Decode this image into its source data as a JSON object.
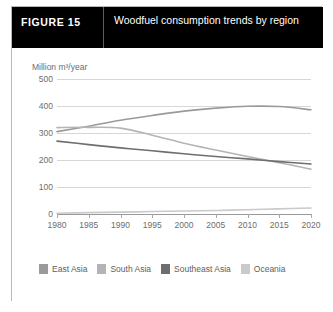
{
  "figure": {
    "label": "FIGURE  15",
    "title": "Woodfuel consumption trends by region"
  },
  "colors": {
    "east_asia": "#9a9a9a",
    "south_asia": "#b4b4b4",
    "southeast_asia": "#6e6e6e",
    "oceania": "#cacaca",
    "grid": "#d6d6d6",
    "axis": "#9a9a9a",
    "text": "#6d6d6d",
    "header_bg": "#000000",
    "card_border": "#b9b9b9"
  },
  "legend": {
    "position": "bottom",
    "items": [
      {
        "label": "East Asia",
        "color": "#9a9a9a"
      },
      {
        "label": "South Asia",
        "color": "#b4b4b4"
      },
      {
        "label": "Southeast Asia",
        "color": "#6e6e6e"
      },
      {
        "label": "Oceania",
        "color": "#cacaca"
      }
    ]
  },
  "chart_data": {
    "type": "line",
    "title": "Woodfuel consumption trends by region",
    "xlabel": "",
    "ylabel": "Million m³/year",
    "ylim": [
      0,
      500
    ],
    "xlim": [
      1980,
      2020
    ],
    "yticks": [
      0,
      100,
      200,
      300,
      400,
      500
    ],
    "xticks": [
      1980,
      1985,
      1990,
      1995,
      2000,
      2005,
      2010,
      2015,
      2020
    ],
    "grid": true,
    "x": [
      1980,
      1985,
      1990,
      1995,
      2000,
      2005,
      2010,
      2015,
      2020
    ],
    "series": [
      {
        "name": "East Asia",
        "color": "#9a9a9a",
        "values": [
          305,
          325,
          347,
          365,
          381,
          392,
          399,
          398,
          386
        ]
      },
      {
        "name": "South Asia",
        "color": "#b4b4b4",
        "values": [
          320,
          321,
          318,
          292,
          262,
          237,
          213,
          190,
          166
        ]
      },
      {
        "name": "Southeast Asia",
        "color": "#6e6e6e",
        "values": [
          270,
          257,
          245,
          234,
          223,
          213,
          204,
          194,
          185
        ]
      },
      {
        "name": "Oceania",
        "color": "#cacaca",
        "values": [
          3,
          5,
          7,
          9,
          11,
          13,
          16,
          19,
          22
        ]
      }
    ]
  }
}
